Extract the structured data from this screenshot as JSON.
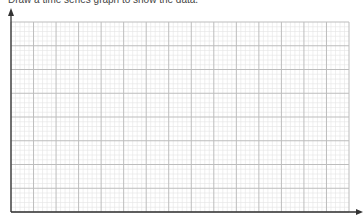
{
  "instruction": "Draw a time series graph to show the data.",
  "chart_data": {
    "type": "line",
    "title": "",
    "xlabel": "",
    "ylabel": "",
    "categories": [],
    "series": [],
    "grid": true,
    "grid_major_columns": 15,
    "grid_major_rows": 8,
    "grid_minor_subdivisions": 5,
    "legend": null
  },
  "colors": {
    "axis": "#333333",
    "major_grid": "#bdbdbd",
    "minor_grid": "#e4e4e4"
  }
}
